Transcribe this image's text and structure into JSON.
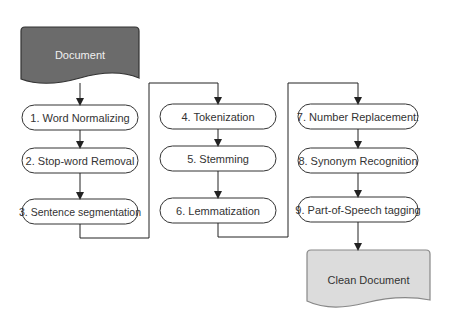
{
  "diagram": {
    "type": "flowchart",
    "input_document": {
      "label": "Document",
      "fill": "#6b6b6b",
      "text_color": "#f0f0f0"
    },
    "output_document": {
      "label": "Clean Document",
      "fill": "#dcdcdc",
      "text_color": "#333333"
    },
    "columns": [
      {
        "steps": [
          {
            "label": "1. Word Normalizing"
          },
          {
            "label": "2. Stop-word Removal"
          },
          {
            "label": "3. Sentence segmentation"
          }
        ]
      },
      {
        "steps": [
          {
            "label": "4. Tokenization"
          },
          {
            "label": "5. Stemming"
          },
          {
            "label": "6. Lemmatization"
          }
        ]
      },
      {
        "steps": [
          {
            "label": "7. Number Replacement:"
          },
          {
            "label": "8. Synonym  Recognition"
          },
          {
            "label": "9. Part-of-Speech tagging"
          }
        ]
      }
    ],
    "edges": [
      "Document -> 1",
      "1 -> 2",
      "2 -> 3",
      "3 -> 4",
      "4 -> 5",
      "5 -> 6",
      "6 -> 7",
      "7 -> 8",
      "8 -> 9",
      "9 -> Clean Document"
    ],
    "colors": {
      "stroke": "#333333",
      "box_fill": "#ffffff"
    }
  }
}
